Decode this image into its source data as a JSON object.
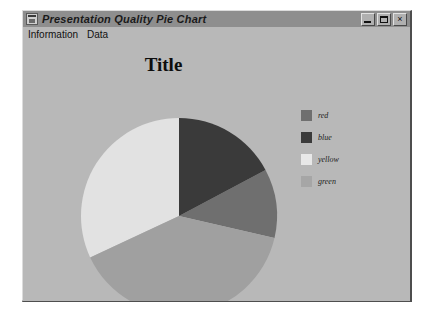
{
  "window": {
    "title": "Presentation Quality Pie Chart",
    "icon": "app-window-icon",
    "buttons": {
      "minimize": "_",
      "maximize": "□",
      "close": "×"
    }
  },
  "menu": {
    "items": [
      {
        "label": "Information"
      },
      {
        "label": "Data"
      }
    ]
  },
  "chart_data": {
    "type": "pie",
    "title": "Title",
    "xlabel": "",
    "ylabel": "",
    "legend_position": "right",
    "grid": false,
    "categories": [
      "red",
      "blue",
      "yellow",
      "green"
    ],
    "slices": [
      {
        "label": "red",
        "value": 11,
        "color": "#6f6f6f",
        "start_deg": 62,
        "end_deg": 103
      },
      {
        "label": "blue",
        "value": 17,
        "color": "#3a3a3a",
        "start_deg": 0,
        "end_deg": 62
      },
      {
        "label": "yellow",
        "value": 40,
        "color": "#e2e2e2",
        "start_deg": 245,
        "end_deg": 360
      },
      {
        "label": "green",
        "value": 32,
        "color": "#a0a0a0",
        "start_deg": 103,
        "end_deg": 245
      }
    ],
    "legend": [
      {
        "label": "red",
        "color": "#6f6f6f"
      },
      {
        "label": "blue",
        "color": "#3a3a3a"
      },
      {
        "label": "yellow",
        "color": "#e8e8e8"
      },
      {
        "label": "green",
        "color": "#a6a6a6"
      }
    ],
    "geometry": {
      "center_x": 156,
      "center_y": 174,
      "radius": 98
    }
  },
  "colors": {
    "window_face": "#b8b8b8",
    "title_bar": "#8e8e8e",
    "text": "#111111"
  }
}
